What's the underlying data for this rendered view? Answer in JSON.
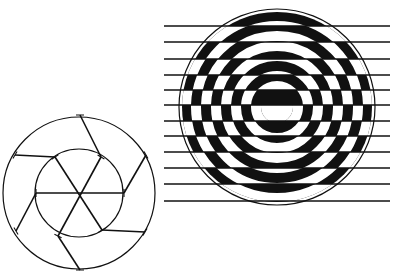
{
  "figure": {
    "colors": {
      "ink": "#111111",
      "paper": "#ffffff"
    }
  },
  "left_diagram": {
    "center": [
      79,
      193
    ],
    "outer_radius": 76,
    "inner_radius": 44,
    "inner_points": [
      [
        55,
        157
      ],
      [
        101,
        157
      ],
      [
        124,
        193
      ],
      [
        102,
        230
      ],
      [
        58,
        236
      ],
      [
        36,
        193
      ]
    ],
    "outer_points": [
      [
        80,
        115
      ],
      [
        146,
        155
      ],
      [
        145,
        232
      ],
      [
        80,
        270
      ],
      [
        16,
        231
      ],
      [
        15,
        155
      ]
    ],
    "connectors": [
      [
        [
          80,
          115
        ],
        [
          101,
          157
        ]
      ],
      [
        [
          146,
          155
        ],
        [
          124,
          193
        ]
      ],
      [
        [
          145,
          232
        ],
        [
          102,
          230
        ]
      ],
      [
        [
          80,
          270
        ],
        [
          58,
          236
        ]
      ],
      [
        [
          16,
          231
        ],
        [
          36,
          193
        ]
      ],
      [
        [
          15,
          155
        ],
        [
          55,
          157
        ]
      ]
    ],
    "spokes": [
      [
        [
          55,
          157
        ],
        [
          102,
          230
        ]
      ],
      [
        [
          101,
          157
        ],
        [
          58,
          236
        ]
      ],
      [
        [
          36,
          193
        ],
        [
          124,
          193
        ]
      ]
    ]
  },
  "right_diagram": {
    "center": [
      277,
      107
    ],
    "outline_radius": 98,
    "ring_width": 10,
    "horizontal_lines_y": [
      26,
      42,
      59,
      75,
      90,
      105,
      121,
      136,
      152,
      168,
      184,
      201
    ],
    "line_x_range": [
      164,
      390
    ]
  }
}
